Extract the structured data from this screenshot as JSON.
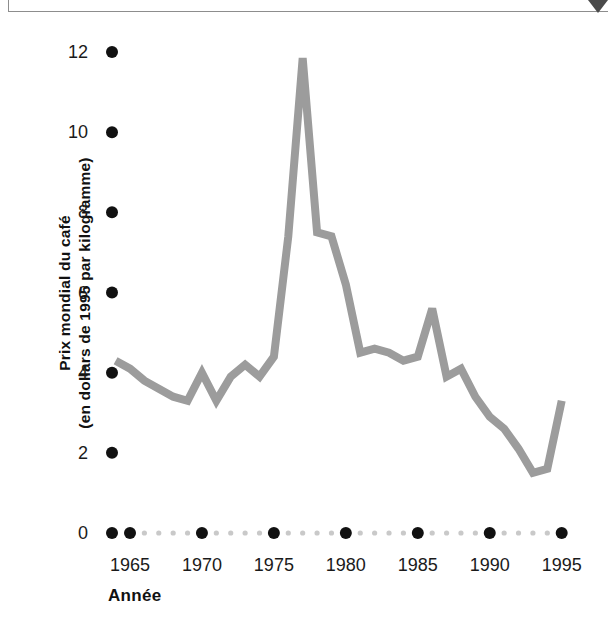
{
  "figure": {
    "top_marker_icon": "triangle-down-icon",
    "line_color": "#9c9c9c",
    "tick_color": "#111111",
    "minor_tick_color": "#c9c9c9"
  },
  "chart_data": {
    "type": "line",
    "title": "",
    "xlabel": "Année",
    "ylabel_line1": "Prix mondial du café",
    "ylabel_line2": "(en dollars de 1995 par kilogramme)",
    "ylabel": "Prix mondial du café (en dollars de 1995 par kilogramme)",
    "grid": false,
    "legend": "none",
    "xlim": [
      1964,
      1996
    ],
    "ylim": [
      0,
      12.6
    ],
    "xticks": [
      1965,
      1970,
      1975,
      1980,
      1985,
      1990,
      1995
    ],
    "xticklabels": [
      "1965",
      "1970",
      "1975",
      "1980",
      "1985",
      "1990",
      "1995"
    ],
    "yticks": [
      0,
      2,
      4,
      6,
      8,
      10,
      12
    ],
    "yticklabels": [
      "0",
      "2",
      "4",
      "6",
      "8",
      "10",
      "12"
    ],
    "minor_xticks": [
      1966,
      1967,
      1968,
      1969,
      1971,
      1972,
      1973,
      1974,
      1976,
      1977,
      1978,
      1979,
      1981,
      1982,
      1983,
      1984,
      1986,
      1987,
      1988,
      1989,
      1991,
      1992,
      1993,
      1994
    ],
    "x": [
      1964,
      1965,
      1966,
      1967,
      1968,
      1969,
      1970,
      1971,
      1972,
      1973,
      1974,
      1975,
      1976,
      1977,
      1978,
      1979,
      1980,
      1981,
      1982,
      1983,
      1984,
      1985,
      1986,
      1987,
      1988,
      1989,
      1990,
      1991,
      1992,
      1993,
      1994,
      1995
    ],
    "values": [
      4.3,
      4.1,
      3.8,
      3.6,
      3.4,
      3.3,
      4.0,
      3.3,
      3.9,
      4.2,
      3.9,
      4.4,
      7.4,
      11.85,
      7.5,
      7.4,
      6.2,
      4.5,
      4.6,
      4.5,
      4.3,
      4.4,
      5.6,
      3.9,
      4.1,
      3.4,
      2.9,
      2.6,
      2.1,
      1.5,
      1.6,
      3.3
    ],
    "series": [
      {
        "name": "Prix mondial du café",
        "values": [
          4.3,
          4.1,
          3.8,
          3.6,
          3.4,
          3.3,
          4.0,
          3.3,
          3.9,
          4.2,
          3.9,
          4.4,
          7.4,
          11.85,
          7.5,
          7.4,
          6.2,
          4.5,
          4.6,
          4.5,
          4.3,
          4.4,
          5.6,
          3.9,
          4.1,
          3.4,
          2.9,
          2.6,
          2.1,
          1.5,
          1.6,
          3.3
        ]
      }
    ]
  }
}
